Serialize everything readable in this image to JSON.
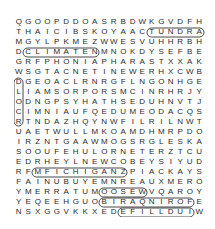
{
  "puzzle": {
    "type": "word-search",
    "columns": 20,
    "rows": [
      "QGOOPDDOASRBDWKGVDFH",
      "THAICIBSKOYAACTUNDRA",
      "MGYLPKMEZWWESVUHHRBH",
      "DCLIMATENMNOKDYSEFBE",
      "GRFPHONIAPHARASTXXAK",
      "WSGTACNETINEWERHXCWB",
      "DGEOACLRNRGFLNGONHGE",
      "LIAMSORPORSMCINRHRJY",
      "ODNGPSYHATHSEDUHNVTJ",
      "CIMNIAUFQEDUMEODACQS",
      "RTNDAZHQYNWFILRILNWT",
      "UAETWULLMKOAMDHMRPDO",
      "IRZNTGAAWMOGSRGLESKA",
      "SOOUFEHULORNETERZTCU",
      "EDRHEYLNEWCOBEYSIYUD",
      "RFMFICHIGANZPIACKAYS",
      "FAINUBUYEMNREAUXMERO",
      "YMERRATUMOOSEWVQAROY",
      "YEQEEHGUOBIRAQNIROFE",
      "NSXGGVKKXEDEFILLDUIW"
    ],
    "found_words_visible": [
      "TUNDRA",
      "CLIMATE",
      "MICHIGAN",
      "WILDFIRE",
      "MOOSE",
      "OBIRAQNIRO"
    ]
  }
}
